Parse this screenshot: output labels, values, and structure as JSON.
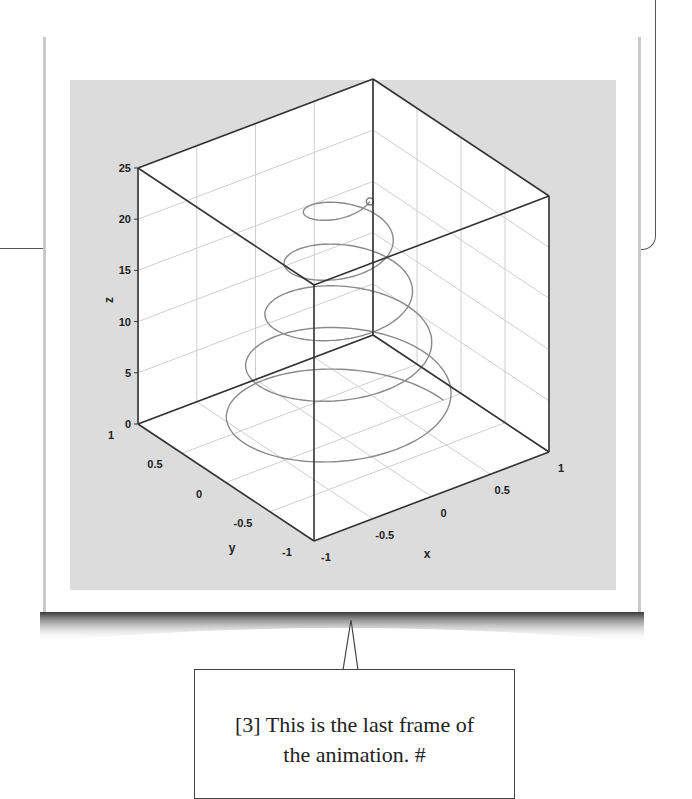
{
  "callout": {
    "line1": "[3] This is the last frame of",
    "line2": "the animation.  #"
  },
  "colors": {
    "plot_background": "#dcdcdc",
    "pane": "#ffffff",
    "box_edge": "#333333",
    "grid": "#cfcfcf",
    "helix": "#8a8a8a"
  },
  "chart_data": {
    "type": "line",
    "subtype": "3d-line",
    "title": "",
    "xlabel": "x",
    "ylabel": "y",
    "zlabel": "z",
    "xlim": [
      -1,
      1
    ],
    "ylim": [
      -1,
      1
    ],
    "zlim": [
      0,
      25
    ],
    "x_ticks": [
      "-1",
      "-0.5",
      "0",
      "0.5",
      "1"
    ],
    "y_ticks": [
      "-1",
      "-0.5",
      "0",
      "0.5",
      "1"
    ],
    "z_ticks": [
      "0",
      "5",
      "10",
      "15",
      "20",
      "25"
    ],
    "grid": true,
    "helix": {
      "z_start": 0,
      "z_end": 24,
      "turns": 4.8,
      "radius_start": 0.85,
      "radius_end": 0.22
    },
    "end_marker": {
      "shape": "open-circle",
      "z": 24
    },
    "legend": null
  }
}
